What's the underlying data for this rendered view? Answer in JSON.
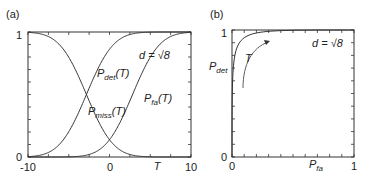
{
  "chart_data": [
    {
      "panel_label": "(a)",
      "type": "line",
      "title": "",
      "xlabel": "T",
      "ylabel": "",
      "xlim": [
        -10,
        10
      ],
      "ylim": [
        0,
        1
      ],
      "x_ticks": [
        "-10",
        "0",
        "10"
      ],
      "y_ticks": [
        "0",
        "1"
      ],
      "annotation": "d = √8",
      "series": [
        {
          "name": "P_det(T)",
          "label_main": "P",
          "label_sub": "det",
          "label_tail": "(T)",
          "description": "1 - Phi(T) shifted; decreasing? no: increasing from ~0.02 at T=-10 to 1",
          "center": -2.83,
          "direction": "up"
        },
        {
          "name": "P_miss(T)",
          "label_main": "P",
          "label_sub": "miss",
          "label_tail": "(T)",
          "center": -2.83,
          "direction": "down"
        },
        {
          "name": "P_fa(T)",
          "label_main": "P",
          "label_sub": "fa",
          "label_tail": "(T)",
          "center": 2.83,
          "direction": "up"
        }
      ],
      "notes": "Sigmoid curves; P_det and P_miss cross at T≈-3 (0.5); P_fa and P_miss cross near T≈0 (≈0.09)"
    },
    {
      "panel_label": "(b)",
      "type": "line",
      "title": "",
      "xlabel": "P_fa",
      "xlabel_main": "P",
      "xlabel_sub": "fa",
      "ylabel": "P_det",
      "ylabel_main": "P",
      "ylabel_sub": "det",
      "xlim": [
        0,
        1
      ],
      "ylim": [
        0,
        1
      ],
      "x_ticks": [
        "0",
        "1"
      ],
      "y_ticks": [
        "0",
        "1"
      ],
      "annotation": "d = √8",
      "arrow_label": "T",
      "series": [
        {
          "name": "ROC",
          "x": [
            0,
            0.005,
            0.01,
            0.02,
            0.05,
            0.1,
            0.2,
            0.3,
            0.5,
            0.7,
            1.0
          ],
          "y": [
            0,
            0.63,
            0.74,
            0.83,
            0.91,
            0.95,
            0.98,
            0.99,
            0.997,
            0.999,
            1.0
          ]
        }
      ]
    }
  ]
}
